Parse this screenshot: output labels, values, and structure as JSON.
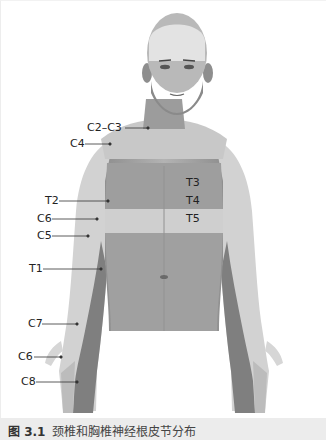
{
  "figure": {
    "title": "颈椎和胸椎神经根皮节分布",
    "number": "图 3.1"
  },
  "labels": {
    "c2_c3": "C2–C3",
    "c4": "C4",
    "t3": "T3",
    "t4": "T4",
    "t5": "T5",
    "t2": "T2",
    "c6_arm": "C6",
    "c5": "C5",
    "t1": "T1",
    "c7": "C7",
    "c6_hand": "C6",
    "c8": "C8"
  },
  "colors": {
    "skin_base": "#a9a9a9",
    "dermatome_light": "#d4d4d4",
    "dermatome_mid": "#b8b8b8",
    "dermatome_dark": "#7d7d7d",
    "caption_bg": "#ececec"
  }
}
